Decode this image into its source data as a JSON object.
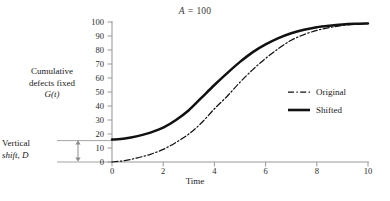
{
  "chart_data": {
    "type": "line",
    "title": "A = 100",
    "title_symbol": "A",
    "title_value": "100",
    "xlabel": "Time",
    "ylabel_lines": [
      "Cumulative",
      "defects fixed",
      "G(t)"
    ],
    "ylabel_function": "G(t)",
    "xlim": [
      0,
      10
    ],
    "ylim": [
      0,
      100
    ],
    "xticks": [
      "0",
      "2",
      "4",
      "6",
      "8",
      "10"
    ],
    "xtick_values": [
      0,
      2,
      4,
      6,
      8,
      10
    ],
    "yticks": [
      "0",
      "10",
      "20",
      "30",
      "40",
      "50",
      "60",
      "70",
      "80",
      "90",
      "100"
    ],
    "ytick_values": [
      0,
      10,
      20,
      30,
      40,
      50,
      60,
      70,
      80,
      90,
      100
    ],
    "grid": false,
    "legend_position": "center-right",
    "series": [
      {
        "name": "Original",
        "style": "dash-dot",
        "color": "#111111",
        "x": [
          0,
          0.5,
          1,
          1.5,
          2,
          2.5,
          3,
          3.5,
          4,
          4.5,
          5,
          5.5,
          6,
          6.5,
          7,
          7.5,
          8,
          8.5,
          9,
          9.5,
          10
        ],
        "y": [
          0,
          1,
          3,
          5.5,
          9,
          14,
          20,
          28,
          38,
          47,
          57,
          66,
          74,
          81,
          87,
          91,
          94,
          96,
          97.5,
          98.5,
          99
        ]
      },
      {
        "name": "Shifted",
        "style": "solid",
        "color": "#111111",
        "x": [
          0,
          0.5,
          1,
          1.5,
          2,
          2.5,
          3,
          3.5,
          4,
          4.5,
          5,
          5.5,
          6,
          6.5,
          7,
          7.5,
          8,
          8.5,
          9,
          9.5,
          10
        ],
        "y": [
          16,
          16.8,
          18.5,
          21,
          24.5,
          30,
          37,
          46,
          55,
          63.5,
          71.5,
          78.5,
          84,
          88.5,
          92,
          94.5,
          96.3,
          97.4,
          98.2,
          98.7,
          99
        ]
      }
    ],
    "annotations": [
      {
        "name": "vertical-shift",
        "text_lines": [
          "Vertical",
          "shift, D"
        ],
        "symbol": "D",
        "from_value": 0,
        "to_value": 16,
        "arrow": "double-headed"
      }
    ],
    "colors": {
      "axis": "#9a9a9a",
      "curve": "#111111",
      "annotation": "#8c8c8c"
    }
  },
  "legend": {
    "items": [
      {
        "label": "Original",
        "style": "dash-dot"
      },
      {
        "label": "Shifted",
        "style": "solid"
      }
    ]
  }
}
